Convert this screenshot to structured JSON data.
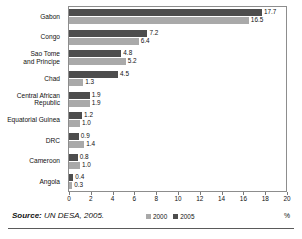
{
  "title": "",
  "chart_data": {
    "type": "bar",
    "orientation": "horizontal",
    "title": "",
    "xlabel": "%",
    "ylabel": "",
    "xlim": [
      0,
      20
    ],
    "xticks": [
      0,
      2,
      4,
      6,
      8,
      10,
      12,
      14,
      16,
      18,
      20
    ],
    "grid": false,
    "legend_position": "bottom-center",
    "categories": [
      "Gabon",
      "Congo",
      "Sao Tome\nand Principe",
      "Chad",
      "Central African\nRepublic",
      "Equatorial Guinea",
      "DRC",
      "Cameroon",
      "Angola"
    ],
    "series": [
      {
        "name": "2005",
        "color": "#4d4d4d",
        "values": [
          17.7,
          7.2,
          4.8,
          4.5,
          1.9,
          1.2,
          0.9,
          0.8,
          0.4
        ],
        "labels": [
          "17.7",
          "7.2",
          "4.8",
          "4.5",
          "1.9",
          "1.2",
          "0.9",
          "0.8",
          "0.4"
        ]
      },
      {
        "name": "2000",
        "color": "#a9a9a9",
        "values": [
          16.5,
          6.4,
          5.2,
          1.3,
          1.9,
          1.0,
          1.4,
          1.0,
          0.3
        ],
        "labels": [
          "16.5",
          "6.4",
          "5.2",
          "1.3",
          "1.9",
          "1.0",
          "1.4",
          "1.0",
          "0.3"
        ]
      }
    ]
  },
  "axis": {
    "tick_labels": [
      "0",
      "2",
      "4",
      "6",
      "8",
      "10",
      "12",
      "14",
      "16",
      "18",
      "20"
    ],
    "unit_label": "%"
  },
  "legend": {
    "items": [
      {
        "label": "2000",
        "color": "#a9a9a9"
      },
      {
        "label": "2005",
        "color": "#4d4d4d"
      }
    ]
  },
  "footer": {
    "source_prefix": "Source:",
    "source_text": " UN DESA, 2005."
  },
  "colors": {
    "series_2000": "#a9a9a9",
    "series_2005": "#4d4d4d",
    "frame": "#8d8d8d",
    "text": "#111111",
    "rule": "#5a5a5a"
  }
}
